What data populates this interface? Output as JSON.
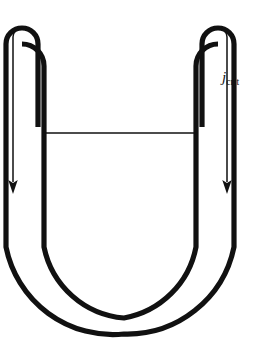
{
  "figure": {
    "type": "line-diagram",
    "width": 257,
    "height": 345,
    "background_color": "#ffffff",
    "stroke_color": "#111111"
  },
  "labels": {
    "flux": {
      "symbol": "j",
      "subscript": "crit",
      "full_text": "jcrit",
      "x": 222,
      "y": 70,
      "color": "#111111"
    }
  },
  "geometry": {
    "outer_wall": {
      "description": "Thick outer U-shaped wall of the tube",
      "stroke_width": 5.0,
      "left_x": 22,
      "right_x": 218,
      "top_y": 22,
      "bottom_y": 334,
      "corner_radius": 98
    },
    "inner_wall": {
      "description": "Thick inner U-shaped wall of the tube",
      "stroke_width": 5.0,
      "left_x": 38,
      "right_x": 202,
      "top_y": 30,
      "bottom_y": 318,
      "corner_radius": 82
    },
    "left_hairpin": {
      "description": "Inverted-U fold at top of left arm",
      "outer_x": 22,
      "inner_x": 38,
      "apex_y": 22,
      "inner_tail_y": 127
    },
    "right_hairpin": {
      "description": "Inverted-U fold at top of right arm",
      "outer_x": 218,
      "inner_x": 202,
      "apex_y": 22,
      "inner_tail_y": 127
    },
    "connecting_line": {
      "description": "Thin horizontal line joining inner walls (liquid surface)",
      "x1": 46,
      "x2": 196,
      "y": 133,
      "stroke_width": 1.2
    },
    "arrows": [
      {
        "name": "left-flux-arrow",
        "direction": "down",
        "x": 14,
        "y_start": 30,
        "y_tip": 193,
        "stroke_width": 1.4,
        "head_width": 9,
        "head_length": 13
      },
      {
        "name": "right-flux-arrow",
        "direction": "down",
        "x": 226,
        "y_start": 30,
        "y_tip": 193,
        "stroke_width": 1.4,
        "head_width": 9,
        "head_length": 13
      }
    ]
  }
}
